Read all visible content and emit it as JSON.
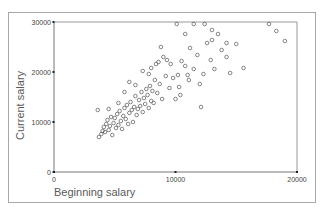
{
  "chart_data": {
    "type": "scatter",
    "title": "",
    "xlabel": "Beginning salary",
    "ylabel": "Current salary",
    "xlim": [
      0,
      20000
    ],
    "ylim": [
      0,
      30000
    ],
    "xticks": [
      "0",
      "10000",
      "20000"
    ],
    "yticks": [
      "0",
      "10000",
      "20000",
      "30000"
    ],
    "grid": false,
    "legend": null,
    "marker": "open-circle",
    "points": [
      [
        3700,
        7000
      ],
      [
        3900,
        7600
      ],
      [
        4000,
        8200
      ],
      [
        4100,
        9000
      ],
      [
        4200,
        8000
      ],
      [
        4300,
        9600
      ],
      [
        4400,
        10400
      ],
      [
        4500,
        8400
      ],
      [
        4600,
        9200
      ],
      [
        4700,
        11000
      ],
      [
        4800,
        7400
      ],
      [
        4900,
        9800
      ],
      [
        5000,
        10800
      ],
      [
        5100,
        8800
      ],
      [
        5200,
        11600
      ],
      [
        5300,
        9400
      ],
      [
        5400,
        12200
      ],
      [
        5500,
        10200
      ],
      [
        5600,
        8600
      ],
      [
        5700,
        11200
      ],
      [
        5800,
        12800
      ],
      [
        5900,
        10600
      ],
      [
        6000,
        13400
      ],
      [
        6100,
        9600
      ],
      [
        6200,
        11800
      ],
      [
        6300,
        14000
      ],
      [
        6400,
        12400
      ],
      [
        6500,
        10000
      ],
      [
        6600,
        13000
      ],
      [
        6700,
        15200
      ],
      [
        6800,
        11400
      ],
      [
        6900,
        12600
      ],
      [
        7000,
        14400
      ],
      [
        7100,
        13200
      ],
      [
        7200,
        16000
      ],
      [
        7300,
        12000
      ],
      [
        7400,
        14800
      ],
      [
        7500,
        13600
      ],
      [
        7600,
        16600
      ],
      [
        7700,
        15400
      ],
      [
        7800,
        12800
      ],
      [
        7900,
        17200
      ],
      [
        8000,
        14200
      ],
      [
        8100,
        16200
      ],
      [
        8200,
        13800
      ],
      [
        8300,
        18400
      ],
      [
        8500,
        15800
      ],
      [
        8700,
        17600
      ],
      [
        8900,
        14600
      ],
      [
        9200,
        19200
      ],
      [
        9500,
        16800
      ],
      [
        9800,
        18800
      ],
      [
        3600,
        12400
      ],
      [
        5800,
        16000
      ],
      [
        6700,
        17400
      ],
      [
        7800,
        19600
      ],
      [
        8400,
        21600
      ],
      [
        9300,
        22400
      ],
      [
        8800,
        25000
      ],
      [
        8000,
        20800
      ],
      [
        10000,
        14600
      ],
      [
        10200,
        19400
      ],
      [
        10500,
        22200
      ],
      [
        10800,
        21200
      ],
      [
        11000,
        19400
      ],
      [
        11200,
        24800
      ],
      [
        11500,
        20600
      ],
      [
        11800,
        23400
      ],
      [
        12000,
        17600
      ],
      [
        12100,
        13000
      ],
      [
        12300,
        19600
      ],
      [
        12600,
        25800
      ],
      [
        12900,
        22400
      ],
      [
        13000,
        26400
      ],
      [
        13200,
        20600
      ],
      [
        13500,
        27600
      ],
      [
        13800,
        24400
      ],
      [
        14200,
        23000
      ],
      [
        14500,
        19800
      ],
      [
        15000,
        25600
      ],
      [
        15600,
        20800
      ],
      [
        10100,
        29800
      ],
      [
        10800,
        27600
      ],
      [
        11500,
        29600
      ],
      [
        13000,
        28400
      ],
      [
        14200,
        25800
      ],
      [
        17700,
        30000
      ],
      [
        18300,
        28200
      ],
      [
        19000,
        26200
      ],
      [
        12400,
        30400
      ],
      [
        9000,
        23000
      ],
      [
        8600,
        22000
      ],
      [
        9600,
        21600
      ],
      [
        10300,
        17000
      ],
      [
        10400,
        15400
      ],
      [
        11100,
        18400
      ],
      [
        7300,
        20200
      ],
      [
        6200,
        18000
      ],
      [
        5300,
        13800
      ],
      [
        4500,
        12600
      ]
    ]
  }
}
